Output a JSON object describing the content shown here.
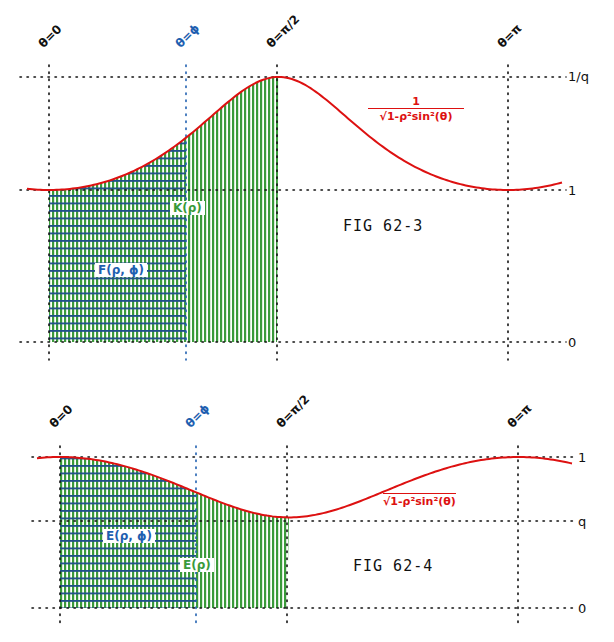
{
  "colors": {
    "curve": "#dd1111",
    "fill_vertical": "#3a9a3a",
    "fill_horizontal": "#1f4f8a",
    "phi_label": "#1f5fb0",
    "green_label": "#3a9a3a",
    "axis_dots": "#111111"
  },
  "chart_data": [
    {
      "type": "area",
      "title": "FIG 62-3",
      "function_label": {
        "numerator": "1",
        "denominator": "√1-ρ²sin²(θ)"
      },
      "x_markers": [
        "θ=0",
        "θ=ϕ",
        "θ=π/2",
        "θ=π"
      ],
      "y_ticks": [
        "1/q",
        "1",
        "0"
      ],
      "y_values": [
        1.667,
        1.0,
        0.0
      ],
      "shaded_regions": [
        {
          "label": "F(ρ, ϕ)",
          "from": "θ=0",
          "to": "θ=ϕ",
          "pattern": "cross-hatched"
        },
        {
          "label": "K(ρ)",
          "from": "θ=0",
          "to": "θ=π/2",
          "pattern": "vertical"
        }
      ],
      "curve": {
        "description": "1/sqrt(1-ρ² sin²θ), min 1 at θ=0 and θ=π, max 1/q at θ=π/2",
        "x": [
          -0.3,
          0,
          0.39,
          0.785,
          1.18,
          1.571,
          1.96,
          2.36,
          2.75,
          3.14,
          3.5
        ],
        "y": [
          1.05,
          1.0,
          1.07,
          1.27,
          1.55,
          1.667,
          1.55,
          1.27,
          1.07,
          1.0,
          1.05
        ]
      },
      "grid": false,
      "legend": "none"
    },
    {
      "type": "area",
      "title": "FIG 62-4",
      "function_label": {
        "expression": "√1-ρ²sin²(θ)"
      },
      "x_markers": [
        "θ=0",
        "θ=ϕ",
        "θ=π/2",
        "θ=π"
      ],
      "y_ticks": [
        "1",
        "q",
        "0"
      ],
      "y_values": [
        1.0,
        0.6,
        0.0
      ],
      "shaded_regions": [
        {
          "label": "E(ρ, ϕ)",
          "from": "θ=0",
          "to": "θ=ϕ",
          "pattern": "cross-hatched"
        },
        {
          "label": "E(ρ)",
          "from": "θ=0",
          "to": "θ=π/2",
          "pattern": "vertical"
        }
      ],
      "curve": {
        "description": "sqrt(1-ρ² sin²θ), max 1 at θ=0 and θ=π, min q at θ=π/2",
        "x": [
          -0.3,
          0,
          0.39,
          0.785,
          1.18,
          1.571,
          1.96,
          2.36,
          2.75,
          3.14,
          3.5
        ],
        "y": [
          0.99,
          1.0,
          0.94,
          0.79,
          0.64,
          0.6,
          0.64,
          0.79,
          0.94,
          1.0,
          0.96
        ]
      },
      "grid": false,
      "legend": "none"
    }
  ],
  "fig1": {
    "title": "FIG 62-3",
    "markers": {
      "zero": "θ=0",
      "phi": "θ=ϕ",
      "half_pi": "θ=π/2",
      "pi": "θ=π"
    },
    "ticks": {
      "top": "1/q",
      "mid": "1",
      "bottom": "0"
    },
    "region_inner": "F(ρ, ϕ)",
    "region_outer": "K(ρ)",
    "formula_num": "1",
    "formula_den": "√1-ρ²sin²(θ)"
  },
  "fig2": {
    "title": "FIG 62-4",
    "markers": {
      "zero": "θ=0",
      "phi": "θ=ϕ",
      "half_pi": "θ=π/2",
      "pi": "θ=π"
    },
    "ticks": {
      "top": "1",
      "mid": "q",
      "bottom": "0"
    },
    "region_inner": "E(ρ, ϕ)",
    "region_outer": "E(ρ)",
    "formula": "√1-ρ²sin²(θ)"
  }
}
